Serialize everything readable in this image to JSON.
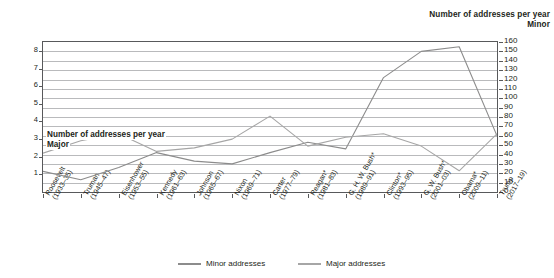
{
  "header": {
    "line1": "Number of addresses per year",
    "line2": "Minor"
  },
  "inner_caption": {
    "line1": "Number of addresses per year",
    "line2": "Major"
  },
  "legend": {
    "minor_label": "Minor addresses",
    "major_label": "Major addresses",
    "minor_color": "#8c8c8c",
    "major_color": "#a6a6a6"
  },
  "chart_data": {
    "type": "line",
    "title": "Number of addresses per year",
    "xlabel": "",
    "ylabel_right": "Minor",
    "ylabel_left": "Major",
    "grid": true,
    "legend_position": "bottom",
    "categories": [
      "Roosevelt (1933–35)",
      "Truman (1945–47)",
      "Eisenhower (1953–55)",
      "Kennedy (1961–63)",
      "Johnson (1965–67)",
      "Nixon (1969–71)",
      "Carter (1977–79)",
      "Reagan* (1981–83)",
      "G. H. W. Bush* (1989–91)",
      "Clinton* (1993–95)",
      "G. W. Bush* (2001–03)",
      "Obama* (2009–11)",
      "Trump (2017–19)"
    ],
    "category_lines": [
      [
        "Roosevelt",
        "(1933–35)"
      ],
      [
        "Truman",
        "(1945–47)"
      ],
      [
        "Eisenhower",
        "(1953–55)"
      ],
      [
        "Kennedy",
        "(1961–63)"
      ],
      [
        "Johnson",
        "(1965–67)"
      ],
      [
        "Nixon",
        "(1969–71)"
      ],
      [
        "Carter",
        "(1977–79)"
      ],
      [
        "Reagan*",
        "(1981–83)"
      ],
      [
        "G. H. W. Bush*",
        "(1989–91)"
      ],
      [
        "Clinton*",
        "(1993–95)"
      ],
      [
        "G. W. Bush*",
        "(2001–03)"
      ],
      [
        "Obama*",
        "(2009–11)"
      ],
      [
        "Trump",
        "(2017–19)"
      ]
    ],
    "axis_right": {
      "name": "Minor",
      "ticks": [
        0,
        10,
        20,
        30,
        40,
        50,
        60,
        70,
        80,
        90,
        100,
        110,
        120,
        130,
        140,
        150,
        160
      ],
      "range": [
        0,
        160
      ]
    },
    "axis_left": {
      "name": "Major",
      "ticks": [
        1,
        2,
        3,
        4,
        5,
        6,
        7,
        8
      ],
      "range": [
        0,
        8.5
      ]
    },
    "series": [
      {
        "name": "Minor addresses",
        "axis": "right",
        "color": "#8c8c8c",
        "values": [
          22,
          13,
          26,
          42,
          33,
          30,
          42,
          53,
          46,
          122,
          150,
          155,
          60
        ]
      },
      {
        "name": "Major addresses",
        "axis": "left",
        "color": "#a6a6a6",
        "values": [
          2.2,
          2.9,
          3.3,
          2.3,
          2.5,
          3.0,
          4.3,
          2.6,
          3.1,
          3.3,
          2.6,
          1.2,
          3.3
        ]
      }
    ]
  }
}
